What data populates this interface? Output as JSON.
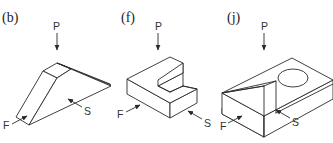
{
  "panels": [
    {
      "id": "b",
      "label": "(b)",
      "shape": "wedge",
      "views": {
        "top": "P",
        "front": "F",
        "side": "S"
      }
    },
    {
      "id": "f",
      "label": "(f)",
      "shape": "notched-block",
      "views": {
        "top": "P",
        "front": "F",
        "side": "S"
      }
    },
    {
      "id": "j",
      "label": "(j)",
      "shape": "block-with-cylindrical-hole-and-chamfer",
      "views": {
        "top": "P",
        "front": "F",
        "side": "S"
      }
    }
  ],
  "colors": {
    "line": "#2a2a2a",
    "background": "#ffffff"
  }
}
